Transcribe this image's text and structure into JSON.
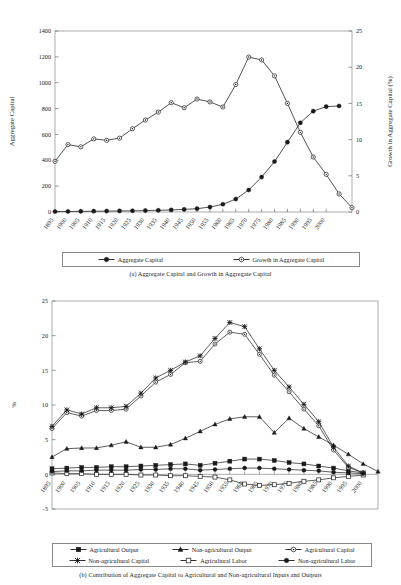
{
  "document": {
    "page_background": "#ffffff",
    "ink_color": "#1a1a1a"
  },
  "figure_a": {
    "caption": "(a) Aggregate Capital and Growth in Aggregate Capital",
    "legend": [
      {
        "label": "Aggregate Capital",
        "marker": "filled-circle"
      },
      {
        "label": "Growth in Aggregate Capital",
        "marker": "open-circle"
      }
    ]
  },
  "figure_b": {
    "caption": "(b) Contribution of Aggregate Capital to Agricultural and Non-agricultural Inputs and Outputs",
    "legend": [
      {
        "label": "Agricultural Output",
        "marker": "filled-square"
      },
      {
        "label": "Non-agricultural Output",
        "marker": "filled-triangle"
      },
      {
        "label": "Agricultural Capital",
        "marker": "open-circle"
      },
      {
        "label": "Non-agricultural Capital",
        "marker": "star-x"
      },
      {
        "label": "Agricultural Labor",
        "marker": "open-square"
      },
      {
        "label": "Non-agricultural Labor",
        "marker": "filled-circle"
      }
    ]
  },
  "chart_data": [
    {
      "id": "a",
      "type": "line",
      "title": "(a) Aggregate Capital and Growth in Aggregate Capital",
      "xlabel": "",
      "ylabel": "Aggregate Capital",
      "y2label": "Growth in Aggregate Capital (%)",
      "xlim": [
        1895,
        2000
      ],
      "ylim": [
        0,
        1400
      ],
      "yticks": [
        0,
        200,
        400,
        600,
        800,
        1000,
        1200,
        1400
      ],
      "y2lim": [
        0,
        25
      ],
      "y2ticks": [
        0,
        5,
        10,
        15,
        20,
        25
      ],
      "grid": false,
      "legend_position": "below-axes",
      "categories": [
        1895,
        1900,
        1905,
        1910,
        1915,
        1920,
        1925,
        1930,
        1935,
        1940,
        1945,
        1950,
        1955,
        1960,
        1965,
        1970,
        1975,
        1980,
        1985,
        1990,
        1995,
        2000
      ],
      "series": [
        {
          "name": "Aggregate Capital",
          "axis": "left",
          "marker": "filled-circle",
          "values": [
            3,
            4,
            5,
            6,
            7,
            8,
            9,
            11,
            13,
            16,
            20,
            26,
            38,
            60,
            100,
            170,
            270,
            390,
            540,
            690,
            780,
            815,
            820
          ]
        },
        {
          "name": "Growth in Aggregate Capital",
          "axis": "right",
          "marker": "open-circle",
          "units": "percent",
          "values": [
            7.0,
            9.3,
            9.0,
            10.1,
            9.9,
            10.2,
            11.5,
            12.7,
            13.8,
            15.1,
            14.4,
            15.6,
            15.2,
            14.5,
            17.6,
            21.4,
            21.0,
            18.8,
            15.0,
            11.0,
            7.6,
            5.2,
            2.5,
            0.6
          ]
        }
      ],
      "series_note": "Growth series plotted on right axis (0-25%); Aggregate Capital on left axis (0-1400)."
    },
    {
      "id": "b",
      "type": "line",
      "title": "(b) Contribution of Aggregate Capital to Agricultural and Non-agricultural Inputs and Outputs",
      "xlabel": "",
      "ylabel": "%",
      "xlim": [
        1895,
        2000
      ],
      "ylim": [
        -5,
        25
      ],
      "yticks": [
        -5,
        0,
        5,
        10,
        15,
        20,
        25
      ],
      "grid": false,
      "legend_position": "below-axes",
      "categories": [
        1895,
        1900,
        1905,
        1910,
        1915,
        1920,
        1925,
        1930,
        1935,
        1940,
        1945,
        1950,
        1955,
        1960,
        1965,
        1970,
        1975,
        1980,
        1985,
        1990,
        1995,
        2000
      ],
      "series": [
        {
          "name": "Agricultural Output",
          "marker": "filled-square",
          "values": [
            0.8,
            0.9,
            1.0,
            1.0,
            1.1,
            1.1,
            1.2,
            1.3,
            1.4,
            1.5,
            1.3,
            1.6,
            1.9,
            2.2,
            2.2,
            2.0,
            1.7,
            1.5,
            1.2,
            0.9,
            0.5,
            0.2
          ]
        },
        {
          "name": "Non-agricultural Output",
          "marker": "filled-triangle",
          "values": [
            2.5,
            3.7,
            3.8,
            3.8,
            4.2,
            4.7,
            3.9,
            3.9,
            4.3,
            5.2,
            6.2,
            7.2,
            8.0,
            8.3,
            8.3,
            6.0,
            8.1,
            6.6,
            5.4,
            4.2,
            2.9,
            1.5,
            0.4
          ]
        },
        {
          "name": "Agricultural Capital",
          "marker": "open-circle",
          "values": [
            6.6,
            8.9,
            8.4,
            9.2,
            9.2,
            9.4,
            11.3,
            13.3,
            14.4,
            16.1,
            16.3,
            18.8,
            20.5,
            20.2,
            17.3,
            14.3,
            11.9,
            9.4,
            7.0,
            3.5,
            1.0,
            0.2
          ]
        },
        {
          "name": "Non-agricultural Capital",
          "marker": "star-x",
          "values": [
            6.9,
            9.3,
            8.7,
            9.6,
            9.6,
            9.8,
            11.7,
            13.9,
            15.0,
            16.2,
            17.1,
            19.6,
            21.9,
            21.3,
            18.1,
            15.0,
            12.6,
            10.1,
            7.6,
            3.9,
            1.2,
            0.2
          ]
        },
        {
          "name": "Agricultural Labor",
          "marker": "open-square",
          "values": [
            0.2,
            0.1,
            0.1,
            0.0,
            0.0,
            0.0,
            -0.1,
            -0.1,
            -0.2,
            -0.2,
            -0.3,
            -0.4,
            -0.8,
            -1.4,
            -1.6,
            -1.5,
            -1.3,
            -1.0,
            -0.8,
            -0.5,
            -0.3,
            -0.1
          ]
        },
        {
          "name": "Non-agricultural Labor",
          "marker": "filled-circle",
          "values": [
            0.4,
            0.5,
            0.5,
            0.6,
            0.6,
            0.6,
            0.7,
            0.7,
            0.8,
            0.8,
            0.6,
            0.7,
            0.8,
            0.9,
            0.9,
            0.8,
            0.7,
            0.6,
            0.5,
            0.3,
            0.2,
            0.1
          ]
        }
      ]
    }
  ]
}
